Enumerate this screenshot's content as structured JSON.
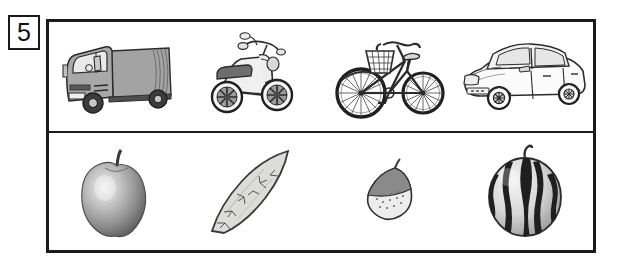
{
  "question": {
    "number": "5",
    "label": "question-number"
  },
  "panel": {
    "rows": [
      {
        "name": "vehicles",
        "items": [
          {
            "name": "truck",
            "label": "truck",
            "icon": "truck-icon",
            "color": "#9a9a9a"
          },
          {
            "name": "scooter",
            "label": "motor scooter",
            "icon": "scooter-icon",
            "color": "#e8e8e8"
          },
          {
            "name": "bicycle",
            "label": "bicycle",
            "icon": "bicycle-icon",
            "color": "#ffffff"
          },
          {
            "name": "car",
            "label": "car",
            "icon": "car-icon",
            "color": "#fbfbfb"
          }
        ]
      },
      {
        "name": "produce",
        "items": [
          {
            "name": "apple",
            "label": "apple",
            "icon": "apple-icon",
            "color": "#9e9e9e"
          },
          {
            "name": "sweet-potato",
            "label": "sweet potato",
            "icon": "sweet-potato-icon",
            "color": "#d8d8d4"
          },
          {
            "name": "chestnut",
            "label": "chestnut",
            "icon": "chestnut-icon",
            "color": "#8d8d8d"
          },
          {
            "name": "watermelon",
            "label": "watermelon",
            "icon": "watermelon-icon",
            "color": "#d0d0d0"
          }
        ]
      }
    ]
  },
  "style": {
    "frame_color": "#1b1b1b",
    "background": "#ffffff",
    "ink": "#2b2b2b"
  }
}
